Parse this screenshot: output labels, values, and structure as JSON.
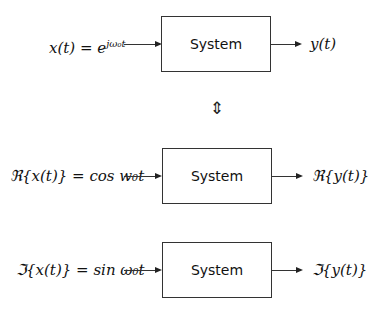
{
  "rows": [
    {
      "input": "x(t) = e^{jω₀t}",
      "input_text": "x(t) = e",
      "input_sup": "jω₀t",
      "block": "System",
      "output": "y(t)"
    },
    {
      "input": "ℜ{x(t)} = cos w₀t",
      "input_text": "ℜ{x(t)} = cos w₀t",
      "block": "System",
      "output": "ℜ{y(t)}"
    },
    {
      "input": "ℑ{x(t)} = sin ω₀t",
      "input_text": "ℑ{x(t)} = sin ω₀t",
      "block": "System",
      "output": "ℑ{y(t)}"
    }
  ],
  "equivalence_symbol": "⇕"
}
